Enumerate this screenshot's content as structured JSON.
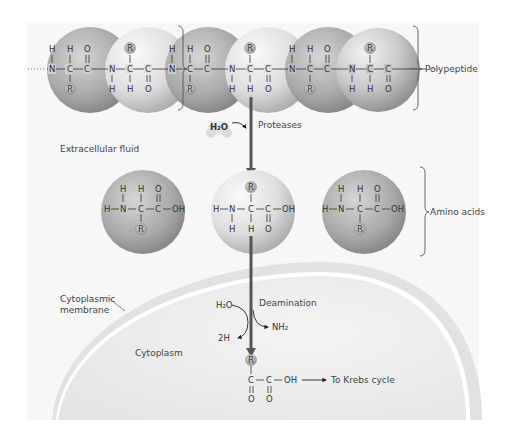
{
  "diagram": {
    "colors": {
      "background": "#f7f7f7",
      "sphere_light": "#e6e6e6",
      "sphere_dark": "#8f8f8f",
      "arrow": "#555555",
      "membrane": "#d4d4d4",
      "cytoplasm": "#eeeeee",
      "text": "#333333"
    },
    "labels": {
      "polypeptide": "Polypeptide",
      "proteases": "Proteases",
      "water": "H₂O",
      "extracellular_fluid": "Extracellular fluid",
      "amino_acids": "Amino acids",
      "cytoplasmic_membrane_line1": "Cytoplasmic",
      "cytoplasmic_membrane_line2": "membrane",
      "cytoplasm": "Cytoplasm",
      "deamination": "Deamination",
      "deamination_in": "H₂O",
      "deamination_out_h": "2H",
      "deamination_out_nh2": "NH₂",
      "krebs": "To Krebs cycle",
      "ellipsis_left": "···",
      "ellipsis_right": "···"
    },
    "chem": {
      "H": "H",
      "N": "N",
      "C": "C",
      "O": "O",
      "R": "R",
      "OH": "OH",
      "bond_h": "—",
      "bond_v": "|",
      "double_v": "‖"
    },
    "polypeptide_residues": 6,
    "free_amino_acids": 3
  }
}
